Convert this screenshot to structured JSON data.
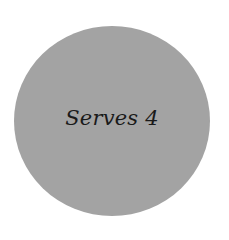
{
  "badge": {
    "text": "Serves 4",
    "fill_color": "#a3a3a3",
    "text_color": "#1a1a1a"
  }
}
